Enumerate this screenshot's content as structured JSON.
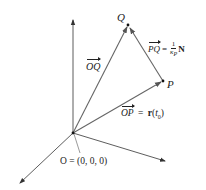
{
  "diagram": {
    "type": "vector-geometry-3d",
    "colors": {
      "axes": "#333333",
      "vectors": "#666666",
      "text": "#222222",
      "background": "#ffffff"
    },
    "points": {
      "O": {
        "label": "O",
        "coords_label": "O = (0, 0, 0)"
      },
      "P": {
        "label": "P"
      },
      "Q": {
        "label": "Q"
      }
    },
    "vectors": {
      "OQ": {
        "label": "OQ"
      },
      "OP": {
        "label": "OP",
        "eq": "=",
        "rhs_func": "r",
        "rhs_arg": "t",
        "rhs_sub": "0"
      },
      "PQ": {
        "label": "PQ",
        "eq": "=",
        "frac_num": "1",
        "frac_den": "κ",
        "frac_den_sub": "P",
        "rhs_vec": "N"
      }
    },
    "axes": [
      "z-axis-up",
      "x-axis-down-left",
      "y-axis-right"
    ]
  }
}
